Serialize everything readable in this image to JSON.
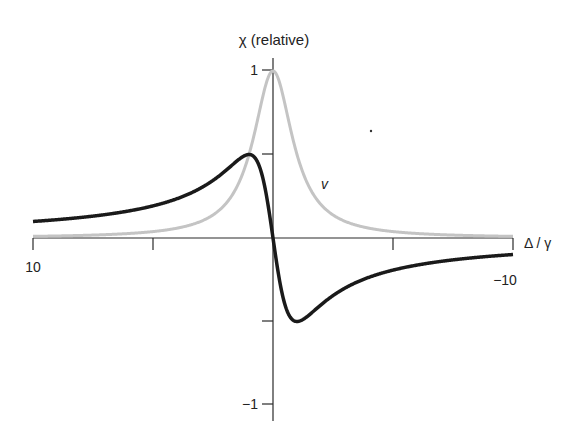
{
  "chart_data": {
    "type": "line",
    "title": "χ (relative)",
    "xlabel": "Δ / γ",
    "ylabel": "χ (relative)",
    "xlim": [
      10,
      -10
    ],
    "ylim": [
      -1,
      1
    ],
    "x_reversed": true,
    "x_ticks": [
      10,
      5,
      0,
      -5,
      -10
    ],
    "x_tick_labels": [
      {
        "value": 10,
        "label": "10"
      },
      {
        "value": -10,
        "label": "−10"
      }
    ],
    "y_ticks": [
      1,
      0.5,
      -0.5,
      -1
    ],
    "y_tick_labels": [
      {
        "value": 1,
        "label": "1"
      },
      {
        "value": -1,
        "label": "−1"
      }
    ],
    "grid": false,
    "legend": "none",
    "annotations": [
      {
        "text": "v",
        "near_series": "absorption",
        "x": -2.2,
        "y": 0.33
      }
    ],
    "series": [
      {
        "name": "absorption (χ″)",
        "color": "#c4c4c4",
        "formula": "1/(1+x^2)",
        "x": [
          10,
          8,
          6,
          5,
          4,
          3,
          2,
          1.5,
          1,
          0.5,
          0,
          -0.5,
          -1,
          -1.5,
          -2,
          -3,
          -4,
          -5,
          -6,
          -8,
          -10
        ],
        "values": [
          0.01,
          0.015,
          0.027,
          0.038,
          0.059,
          0.1,
          0.2,
          0.308,
          0.5,
          0.8,
          1.0,
          0.8,
          0.5,
          0.308,
          0.2,
          0.1,
          0.059,
          0.038,
          0.027,
          0.015,
          0.01
        ]
      },
      {
        "name": "dispersion (χ′)",
        "color": "#1a1a1a",
        "formula": "x/(1+x^2)",
        "x": [
          10,
          8,
          6,
          5,
          4,
          3,
          2,
          1.5,
          1,
          0.5,
          0,
          -0.5,
          -1,
          -1.5,
          -2,
          -3,
          -4,
          -5,
          -6,
          -8,
          -10
        ],
        "values": [
          0.099,
          0.123,
          0.162,
          0.192,
          0.235,
          0.3,
          0.4,
          0.462,
          0.5,
          0.4,
          0.0,
          -0.4,
          -0.5,
          -0.462,
          -0.4,
          -0.3,
          -0.235,
          -0.192,
          -0.162,
          -0.123,
          -0.099
        ]
      }
    ]
  },
  "labels": {
    "title": "χ (relative)",
    "xaxis": "Δ / γ",
    "x_left": "10",
    "x_right": "−10",
    "y_top": "1",
    "y_bottom": "−1",
    "curve_label": "v"
  },
  "layout": {
    "origin_px": [
      273,
      238
    ],
    "px_per_x_unit": 24,
    "px_per_y_unit": 167
  }
}
